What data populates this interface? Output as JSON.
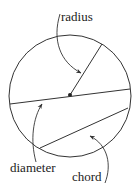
{
  "diagram": {
    "labels": {
      "radius": "radius",
      "diameter": "diameter",
      "chord": "chord"
    },
    "colors": {
      "stroke": "#333333",
      "text": "#222222",
      "background": "#ffffff"
    }
  }
}
